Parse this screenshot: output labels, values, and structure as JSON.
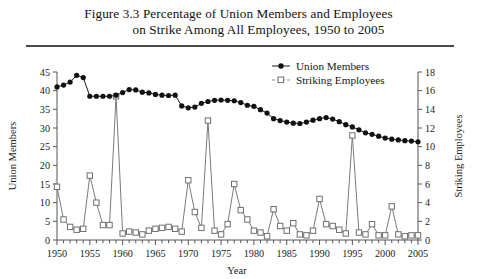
{
  "figure": {
    "title_line1": "Figure 3.3  Percentage of Union Members and Employees",
    "title_line2": "on Strike Among All Employees, 1950 to 2005"
  },
  "legend": [
    {
      "label": "Union Members",
      "marker": "filled-circle",
      "color": "#111111"
    },
    {
      "label": "Striking Employees",
      "marker": "open-square",
      "color": "#7a7a7a"
    }
  ],
  "chart_data": {
    "type": "line",
    "title": "Figure 3.3  Percentage of Union Members and Employees on Strike Among All Employees, 1950 to 2005",
    "xlabel": "Year",
    "ylabel": "Union Members",
    "y2label": "Striking Employees",
    "xlim": [
      1950,
      2005
    ],
    "ylim": [
      0,
      45
    ],
    "y2lim": [
      0,
      18
    ],
    "yticks": [
      0,
      5,
      10,
      15,
      20,
      25,
      30,
      35,
      40,
      45
    ],
    "y2ticks": [
      0,
      2,
      4,
      6,
      8,
      10,
      12,
      14,
      16,
      18
    ],
    "xticks": [
      1950,
      1955,
      1960,
      1965,
      1970,
      1975,
      1980,
      1985,
      1990,
      1995,
      2000,
      2005
    ],
    "xtick_minor_interval": 1,
    "grid": false,
    "legend_position": "top-right-inside",
    "x": [
      1950,
      1951,
      1952,
      1953,
      1954,
      1955,
      1956,
      1957,
      1958,
      1959,
      1960,
      1961,
      1962,
      1963,
      1964,
      1965,
      1966,
      1967,
      1968,
      1969,
      1970,
      1971,
      1972,
      1973,
      1974,
      1975,
      1976,
      1977,
      1978,
      1979,
      1980,
      1981,
      1982,
      1983,
      1984,
      1985,
      1986,
      1987,
      1988,
      1989,
      1990,
      1991,
      1992,
      1993,
      1994,
      1995,
      1996,
      1997,
      1998,
      1999,
      2000,
      2001,
      2002,
      2003,
      2004,
      2005
    ],
    "series": [
      {
        "name": "Union Members",
        "axis": "left",
        "marker": "filled-circle",
        "values": [
          41.0,
          41.5,
          42.3,
          44.1,
          43.5,
          38.5,
          38.5,
          38.5,
          38.5,
          38.8,
          39.5,
          40.3,
          40.2,
          39.6,
          39.4,
          39.0,
          38.8,
          38.7,
          38.8,
          35.9,
          35.4,
          35.6,
          36.6,
          37.1,
          37.4,
          37.5,
          37.4,
          37.3,
          36.8,
          36.1,
          35.8,
          34.9,
          34.0,
          32.5,
          32.0,
          31.6,
          31.3,
          31.2,
          31.6,
          32.1,
          32.5,
          32.8,
          32.4,
          31.7,
          30.9,
          30.3,
          29.5,
          28.7,
          28.3,
          27.8,
          27.3,
          27.0,
          26.8,
          26.6,
          26.5,
          26.3
        ]
      },
      {
        "name": "Striking Employees",
        "axis": "right",
        "marker": "open-square",
        "values": [
          5.7,
          2.2,
          1.4,
          1.1,
          1.2,
          6.9,
          4.0,
          1.6,
          1.6,
          15.4,
          0.7,
          0.9,
          0.8,
          0.6,
          1.0,
          1.2,
          1.3,
          1.4,
          1.2,
          0.9,
          6.4,
          3.0,
          1.3,
          12.8,
          1.0,
          0.6,
          1.7,
          6.0,
          3.2,
          2.2,
          1.0,
          0.8,
          0.4,
          3.3,
          1.5,
          1.0,
          1.8,
          0.6,
          0.5,
          1.0,
          4.4,
          1.7,
          1.5,
          1.1,
          0.7,
          11.2,
          0.8,
          0.6,
          1.7,
          0.5,
          0.5,
          3.6,
          0.6,
          0.4,
          0.5,
          0.5
        ]
      }
    ]
  }
}
